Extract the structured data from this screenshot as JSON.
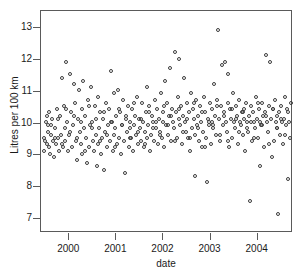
{
  "chart_data": {
    "type": "scatter",
    "title": "",
    "xlabel": "date",
    "ylabel": "Litres per 100 km",
    "xlim": [
      1999.4,
      2004.75
    ],
    "ylim": [
      6.55,
      13.55
    ],
    "grid": false,
    "legend": null,
    "marker": "open-circle",
    "marker_color": "#3c3c3c",
    "xticks": [
      2000,
      2001,
      2002,
      2003,
      2004
    ],
    "xtick_labels": [
      "2000",
      "2001",
      "2002",
      "2003",
      "2004"
    ],
    "yticks": [
      7,
      8,
      9,
      10,
      11,
      12,
      13
    ],
    "ytick_labels": [
      "7",
      "8",
      "9",
      "10",
      "11",
      "12",
      "13"
    ],
    "points": [
      [
        1999.46,
        9.55
      ],
      [
        1999.47,
        9.15
      ],
      [
        1999.5,
        10.05
      ],
      [
        1999.52,
        9.35
      ],
      [
        1999.54,
        9.75
      ],
      [
        1999.55,
        9.95
      ],
      [
        1999.57,
        9.25
      ],
      [
        1999.58,
        10.35
      ],
      [
        1999.6,
        9.05
      ],
      [
        1999.62,
        9.65
      ],
      [
        1999.64,
        10.15
      ],
      [
        1999.66,
        9.45
      ],
      [
        1999.68,
        8.95
      ],
      [
        1999.7,
        9.85
      ],
      [
        1999.72,
        9.35
      ],
      [
        1999.74,
        10.45
      ],
      [
        1999.76,
        9.55
      ],
      [
        1999.78,
        9.15
      ],
      [
        1999.8,
        10.25
      ],
      [
        1999.82,
        9.65
      ],
      [
        1999.84,
        11.45
      ],
      [
        1999.86,
        9.25
      ],
      [
        1999.88,
        10.55
      ],
      [
        1999.9,
        9.85
      ],
      [
        1999.92,
        9.45
      ],
      [
        1999.94,
        11.95
      ],
      [
        1999.96,
        10.05
      ],
      [
        1999.98,
        9.15
      ],
      [
        2000.0,
        9.65
      ],
      [
        2000.02,
        11.55
      ],
      [
        2000.04,
        10.35
      ],
      [
        2000.06,
        9.25
      ],
      [
        2000.08,
        9.95
      ],
      [
        2000.1,
        11.25
      ],
      [
        2000.12,
        10.65
      ],
      [
        2000.14,
        9.45
      ],
      [
        2000.16,
        8.85
      ],
      [
        2000.18,
        10.15
      ],
      [
        2000.2,
        11.05
      ],
      [
        2000.22,
        9.75
      ],
      [
        2000.24,
        9.35
      ],
      [
        2000.26,
        10.45
      ],
      [
        2000.28,
        9.05
      ],
      [
        2000.3,
        11.35
      ],
      [
        2000.32,
        9.85
      ],
      [
        2000.34,
        10.25
      ],
      [
        2000.36,
        9.55
      ],
      [
        2000.38,
        8.75
      ],
      [
        2000.4,
        10.75
      ],
      [
        2000.42,
        9.25
      ],
      [
        2000.44,
        9.95
      ],
      [
        2000.46,
        11.15
      ],
      [
        2000.48,
        10.05
      ],
      [
        2000.5,
        9.45
      ],
      [
        2000.52,
        9.15
      ],
      [
        2000.54,
        10.55
      ],
      [
        2000.56,
        9.65
      ],
      [
        2000.58,
        8.65
      ],
      [
        2000.6,
        10.85
      ],
      [
        2000.62,
        9.35
      ],
      [
        2000.64,
        9.85
      ],
      [
        2000.66,
        10.35
      ],
      [
        2000.68,
        9.05
      ],
      [
        2000.7,
        9.55
      ],
      [
        2000.72,
        10.15
      ],
      [
        2000.74,
        8.55
      ],
      [
        2000.76,
        9.75
      ],
      [
        2000.78,
        10.65
      ],
      [
        2000.8,
        9.25
      ],
      [
        2000.82,
        9.95
      ],
      [
        2000.84,
        10.45
      ],
      [
        2000.86,
        9.45
      ],
      [
        2000.88,
        11.65
      ],
      [
        2000.9,
        10.05
      ],
      [
        2000.92,
        9.15
      ],
      [
        2000.94,
        9.65
      ],
      [
        2000.96,
        10.95
      ],
      [
        2000.98,
        9.85
      ],
      [
        2001.0,
        10.25
      ],
      [
        2001.02,
        9.35
      ],
      [
        2001.04,
        11.05
      ],
      [
        2001.06,
        9.55
      ],
      [
        2001.08,
        10.35
      ],
      [
        2001.1,
        9.05
      ],
      [
        2001.12,
        9.95
      ],
      [
        2001.14,
        10.75
      ],
      [
        2001.16,
        9.45
      ],
      [
        2001.18,
        8.45
      ],
      [
        2001.2,
        10.15
      ],
      [
        2001.22,
        9.75
      ],
      [
        2001.24,
        10.55
      ],
      [
        2001.26,
        9.25
      ],
      [
        2001.28,
        9.85
      ],
      [
        2001.3,
        10.05
      ],
      [
        2001.32,
        9.55
      ],
      [
        2001.34,
        10.45
      ],
      [
        2001.36,
        9.15
      ],
      [
        2001.38,
        9.95
      ],
      [
        2001.4,
        10.25
      ],
      [
        2001.42,
        9.65
      ],
      [
        2001.44,
        10.85
      ],
      [
        2001.46,
        9.35
      ],
      [
        2001.48,
        10.15
      ],
      [
        2001.5,
        9.85
      ],
      [
        2001.52,
        9.45
      ],
      [
        2001.54,
        10.65
      ],
      [
        2001.56,
        10.05
      ],
      [
        2001.58,
        9.25
      ],
      [
        2001.6,
        9.75
      ],
      [
        2001.62,
        10.35
      ],
      [
        2001.64,
        9.55
      ],
      [
        2001.66,
        11.15
      ],
      [
        2001.68,
        9.95
      ],
      [
        2001.7,
        10.55
      ],
      [
        2001.72,
        9.15
      ],
      [
        2001.74,
        9.65
      ],
      [
        2001.76,
        10.25
      ],
      [
        2001.78,
        10.05
      ],
      [
        2001.8,
        9.45
      ],
      [
        2001.82,
        10.75
      ],
      [
        2001.84,
        9.85
      ],
      [
        2001.86,
        10.45
      ],
      [
        2001.88,
        9.35
      ],
      [
        2001.9,
        10.15
      ],
      [
        2001.92,
        9.75
      ],
      [
        2001.94,
        10.95
      ],
      [
        2001.96,
        9.55
      ],
      [
        2001.98,
        10.35
      ],
      [
        2002.0,
        10.05
      ],
      [
        2002.02,
        9.25
      ],
      [
        2002.04,
        11.35
      ],
      [
        2002.06,
        9.95
      ],
      [
        2002.08,
        10.65
      ],
      [
        2002.1,
        9.65
      ],
      [
        2002.12,
        10.25
      ],
      [
        2002.14,
        11.75
      ],
      [
        2002.16,
        9.45
      ],
      [
        2002.18,
        10.45
      ],
      [
        2002.2,
        10.05
      ],
      [
        2002.22,
        9.85
      ],
      [
        2002.24,
        12.25
      ],
      [
        2002.26,
        10.35
      ],
      [
        2002.28,
        9.55
      ],
      [
        2002.3,
        10.85
      ],
      [
        2002.32,
        12.05
      ],
      [
        2002.34,
        10.15
      ],
      [
        2002.36,
        9.95
      ],
      [
        2002.38,
        10.55
      ],
      [
        2002.4,
        9.35
      ],
      [
        2002.42,
        10.25
      ],
      [
        2002.44,
        11.45
      ],
      [
        2002.46,
        10.05
      ],
      [
        2002.48,
        9.75
      ],
      [
        2002.5,
        10.65
      ],
      [
        2002.52,
        9.55
      ],
      [
        2002.54,
        10.35
      ],
      [
        2002.56,
        9.15
      ],
      [
        2002.58,
        10.95
      ],
      [
        2002.6,
        9.85
      ],
      [
        2002.62,
        10.45
      ],
      [
        2002.64,
        10.15
      ],
      [
        2002.66,
        9.65
      ],
      [
        2002.68,
        8.35
      ],
      [
        2002.7,
        10.75
      ],
      [
        2002.72,
        9.95
      ],
      [
        2002.74,
        10.25
      ],
      [
        2002.76,
        9.45
      ],
      [
        2002.78,
        10.55
      ],
      [
        2002.8,
        10.05
      ],
      [
        2002.82,
        9.25
      ],
      [
        2002.84,
        9.75
      ],
      [
        2002.86,
        10.85
      ],
      [
        2002.88,
        10.35
      ],
      [
        2002.9,
        9.55
      ],
      [
        2002.92,
        8.15
      ],
      [
        2002.94,
        10.15
      ],
      [
        2002.96,
        9.95
      ],
      [
        2002.98,
        10.65
      ],
      [
        2003.0,
        9.35
      ],
      [
        2003.02,
        10.45
      ],
      [
        2003.04,
        10.05
      ],
      [
        2003.06,
        9.85
      ],
      [
        2003.08,
        11.25
      ],
      [
        2003.1,
        10.25
      ],
      [
        2003.12,
        9.65
      ],
      [
        2003.14,
        10.75
      ],
      [
        2003.16,
        12.95
      ],
      [
        2003.18,
        10.15
      ],
      [
        2003.2,
        9.45
      ],
      [
        2003.22,
        10.55
      ],
      [
        2003.24,
        11.85
      ],
      [
        2003.26,
        9.95
      ],
      [
        2003.28,
        10.35
      ],
      [
        2003.3,
        11.95
      ],
      [
        2003.32,
        10.05
      ],
      [
        2003.34,
        9.75
      ],
      [
        2003.36,
        11.55
      ],
      [
        2003.38,
        10.65
      ],
      [
        2003.4,
        9.25
      ],
      [
        2003.42,
        10.45
      ],
      [
        2003.44,
        10.15
      ],
      [
        2003.46,
        9.55
      ],
      [
        2003.48,
        10.95
      ],
      [
        2003.5,
        10.05
      ],
      [
        2003.52,
        9.85
      ],
      [
        2003.54,
        10.55
      ],
      [
        2003.56,
        10.25
      ],
      [
        2003.58,
        9.35
      ],
      [
        2003.6,
        10.75
      ],
      [
        2003.62,
        10.05
      ],
      [
        2003.64,
        9.95
      ],
      [
        2003.66,
        10.35
      ],
      [
        2003.68,
        9.65
      ],
      [
        2003.7,
        10.45
      ],
      [
        2003.72,
        10.15
      ],
      [
        2003.74,
        9.15
      ],
      [
        2003.76,
        10.65
      ],
      [
        2003.78,
        10.05
      ],
      [
        2003.8,
        9.75
      ],
      [
        2003.82,
        10.25
      ],
      [
        2003.84,
        7.55
      ],
      [
        2003.86,
        10.55
      ],
      [
        2003.88,
        9.45
      ],
      [
        2003.9,
        10.35
      ],
      [
        2003.92,
        10.05
      ],
      [
        2003.94,
        9.85
      ],
      [
        2003.96,
        10.85
      ],
      [
        2003.98,
        10.15
      ],
      [
        2004.0,
        9.55
      ],
      [
        2004.02,
        10.45
      ],
      [
        2004.04,
        8.65
      ],
      [
        2004.06,
        10.05
      ],
      [
        2004.08,
        9.95
      ],
      [
        2004.1,
        10.65
      ],
      [
        2004.12,
        10.25
      ],
      [
        2004.14,
        9.25
      ],
      [
        2004.16,
        10.35
      ],
      [
        2004.18,
        12.15
      ],
      [
        2004.2,
        10.05
      ],
      [
        2004.22,
        9.75
      ],
      [
        2004.24,
        10.55
      ],
      [
        2004.26,
        11.95
      ],
      [
        2004.28,
        10.15
      ],
      [
        2004.3,
        8.95
      ],
      [
        2004.32,
        10.45
      ],
      [
        2004.34,
        9.45
      ],
      [
        2004.36,
        10.75
      ],
      [
        2004.38,
        10.05
      ],
      [
        2004.4,
        9.85
      ],
      [
        2004.42,
        10.25
      ],
      [
        2004.44,
        7.15
      ],
      [
        2004.46,
        10.35
      ],
      [
        2004.48,
        9.65
      ],
      [
        2004.5,
        10.55
      ],
      [
        2004.52,
        10.05
      ],
      [
        2004.54,
        9.35
      ],
      [
        2004.56,
        10.15
      ],
      [
        2004.58,
        10.85
      ],
      [
        2004.6,
        9.95
      ],
      [
        2004.62,
        10.45
      ],
      [
        2004.64,
        8.25
      ],
      [
        2004.66,
        10.05
      ],
      [
        2004.68,
        9.55
      ],
      [
        2004.7,
        10.65
      ],
      [
        1999.49,
        9.45
      ],
      [
        1999.53,
        10.25
      ],
      [
        1999.61,
        9.95
      ],
      [
        1999.69,
        9.55
      ],
      [
        1999.77,
        10.15
      ],
      [
        1999.85,
        9.35
      ],
      [
        1999.93,
        10.45
      ],
      [
        2000.01,
        9.75
      ],
      [
        2000.09,
        10.25
      ],
      [
        2000.17,
        9.55
      ],
      [
        2000.25,
        10.05
      ],
      [
        2000.33,
        9.15
      ],
      [
        2000.41,
        10.55
      ],
      [
        2000.49,
        9.85
      ],
      [
        2000.57,
        10.15
      ],
      [
        2000.65,
        9.45
      ],
      [
        2000.73,
        10.35
      ],
      [
        2000.81,
        9.65
      ],
      [
        2000.89,
        10.05
      ],
      [
        2000.97,
        9.25
      ],
      [
        2001.05,
        10.45
      ],
      [
        2001.13,
        9.95
      ],
      [
        2001.21,
        10.25
      ],
      [
        2001.29,
        9.55
      ],
      [
        2001.37,
        10.65
      ],
      [
        2001.45,
        9.75
      ],
      [
        2001.53,
        10.15
      ],
      [
        2001.61,
        9.35
      ],
      [
        2001.69,
        10.35
      ],
      [
        2001.77,
        9.85
      ],
      [
        2001.85,
        10.05
      ],
      [
        2001.93,
        9.65
      ],
      [
        2002.01,
        10.55
      ],
      [
        2002.09,
        9.95
      ],
      [
        2002.17,
        10.25
      ],
      [
        2002.25,
        9.45
      ],
      [
        2002.33,
        10.45
      ],
      [
        2002.41,
        9.75
      ],
      [
        2002.49,
        10.15
      ],
      [
        2002.57,
        9.55
      ],
      [
        2002.65,
        10.65
      ],
      [
        2002.73,
        9.85
      ],
      [
        2002.81,
        10.35
      ],
      [
        2002.89,
        9.25
      ],
      [
        2002.97,
        10.05
      ],
      [
        2003.05,
        9.95
      ],
      [
        2003.13,
        10.55
      ],
      [
        2003.21,
        9.65
      ],
      [
        2003.29,
        10.25
      ],
      [
        2003.37,
        9.45
      ],
      [
        2003.45,
        10.45
      ],
      [
        2003.53,
        10.15
      ],
      [
        2003.61,
        9.75
      ],
      [
        2003.69,
        10.35
      ],
      [
        2003.77,
        9.85
      ],
      [
        2003.85,
        10.05
      ],
      [
        2003.93,
        9.55
      ],
      [
        2004.01,
        10.65
      ],
      [
        2004.09,
        9.95
      ],
      [
        2004.17,
        10.25
      ],
      [
        2004.25,
        9.35
      ],
      [
        2004.33,
        10.45
      ],
      [
        2004.41,
        9.85
      ],
      [
        2004.49,
        10.15
      ],
      [
        2004.57,
        9.65
      ],
      [
        2004.65,
        10.35
      ]
    ]
  }
}
